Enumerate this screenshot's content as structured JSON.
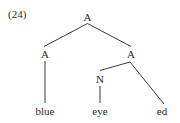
{
  "example": {
    "number": "(24)"
  },
  "tree": {
    "root": {
      "label": "A"
    },
    "left": {
      "label": "A",
      "terminal": "blue"
    },
    "right": {
      "label": "A",
      "noun": {
        "label": "N",
        "terminal": "eye"
      },
      "suffix": "ed"
    }
  },
  "colors": {
    "line": "#3a3a3a",
    "text": "#2a2a2a",
    "background": "#ffffff"
  }
}
